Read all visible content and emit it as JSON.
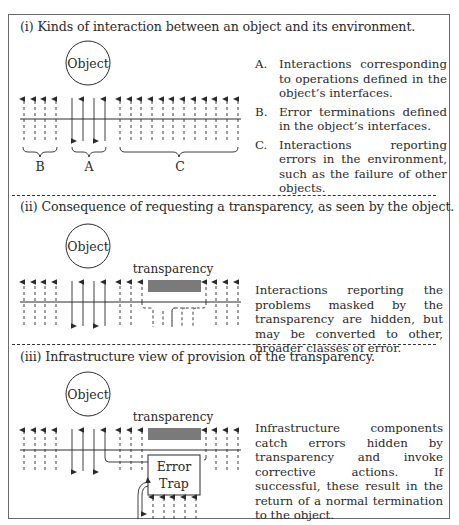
{
  "sections": [
    {
      "id": "i",
      "title": "(i) Kinds of interaction between an object and its environment.",
      "object_label": "Object",
      "brace_labels": [
        "B",
        "A",
        "C"
      ],
      "legend": [
        {
          "key": "A.",
          "text": "Interactions corresponding to operations defined in the object’s interfaces."
        },
        {
          "key": "B.",
          "text": "Error terminations defined in the object’s interfaces."
        },
        {
          "key": "C.",
          "text": "Interactions reporting errors in the environment, such as the failure of other objects."
        }
      ]
    },
    {
      "id": "ii",
      "title": "(ii) Consequence of requesting a transparency, as seen by the object.",
      "object_label": "Object",
      "transparency_label": "transparency",
      "description": "Interactions reporting the problems masked by the transparency are hidden, but may be converted to other, broader classes of error."
    },
    {
      "id": "iii",
      "title": "(iii) Infrastructure view of provision of the transparency.",
      "object_label": "Object",
      "transparency_label": "transparency",
      "error_trap_label_1": "Error",
      "error_trap_label_2": "Trap",
      "description": "Infrastructure components catch errors hidden by transparency and invoke corrective actions. If successful, these result in the return of a normal termination to the object."
    }
  ],
  "colors": {
    "line": "#2a2a2a",
    "transparency_bar": "#7a7a7a",
    "frame": "#6a6a6a"
  }
}
